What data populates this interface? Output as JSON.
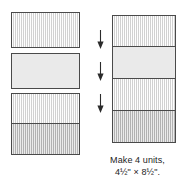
{
  "figure": {
    "kind": "quilt-piecing-diagram",
    "background_color": "#ffffff",
    "outline_color": "#4a4a4a",
    "text_color": "#1d1d1d"
  },
  "left_column": {
    "label": "cut-pieces-column",
    "pieces": [
      {
        "name": "striped-rectangle-top",
        "fill": "#e6e6e6",
        "texture": "striped",
        "x": 11,
        "y": 12,
        "w": 69,
        "h": 36
      },
      {
        "name": "plain-rectangle-middle",
        "fill": "#eaeaea",
        "texture": "plain",
        "x": 11,
        "y": 53,
        "w": 69,
        "h": 36
      },
      {
        "name": "striped-rectangle-pair-upper",
        "fill": "#e6e6e6",
        "texture": "striped",
        "x": 11,
        "y": 93,
        "w": 69,
        "h": 31
      },
      {
        "name": "striped-rectangle-pair-lower",
        "fill": "#c6c6c6",
        "texture": "striped-dark",
        "x": 11,
        "y": 124,
        "w": 69,
        "h": 31
      }
    ]
  },
  "right_column": {
    "label": "assembled-unit-column",
    "pieces": [
      {
        "name": "unit-row-1",
        "fill": "#e6e6e6",
        "texture": "striped",
        "x": 20,
        "y": 15,
        "w": 64,
        "h": 32
      },
      {
        "name": "unit-row-2",
        "fill": "#eaeaea",
        "texture": "plain",
        "x": 20,
        "y": 47,
        "w": 64,
        "h": 32
      },
      {
        "name": "unit-row-3",
        "fill": "#e6e6e6",
        "texture": "striped",
        "x": 20,
        "y": 79,
        "w": 64,
        "h": 32
      },
      {
        "name": "unit-row-4",
        "fill": "#c6c6c6",
        "texture": "striped-dark",
        "x": 20,
        "y": 111,
        "w": 64,
        "h": 32
      }
    ],
    "arrows": [
      {
        "name": "assembly-arrow-1",
        "x": 3,
        "y": 32
      },
      {
        "name": "assembly-arrow-2",
        "x": 3,
        "y": 64
      },
      {
        "name": "assembly-arrow-3",
        "x": 3,
        "y": 96
      }
    ]
  },
  "caption": {
    "line1": "Make 4 units,",
    "line2": "4½\" × 8½\"."
  }
}
